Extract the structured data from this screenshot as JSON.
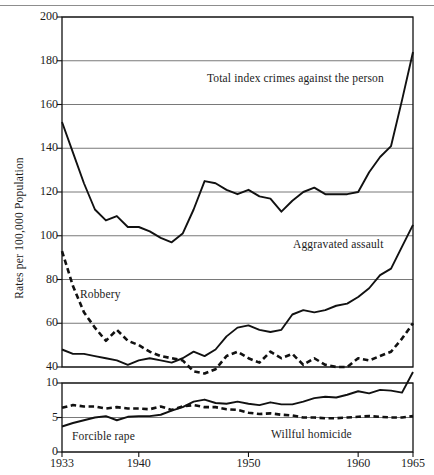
{
  "figure": {
    "ylabel": "Rates per 100,000 Population",
    "top_rule": true
  },
  "axes": {
    "upper": {
      "yticks": [
        200,
        180,
        160,
        140,
        120,
        100,
        80,
        60,
        40
      ],
      "ylim": [
        40,
        200
      ],
      "gridlines": true
    },
    "lower": {
      "yticks": [
        10,
        5,
        0
      ],
      "ylim": [
        0,
        10
      ],
      "gridlines": true
    },
    "xticks": [
      "1933",
      "1940",
      "1950",
      "1960",
      "1965"
    ],
    "xtick_values": [
      1933,
      1940,
      1950,
      1960,
      1965
    ],
    "xlim": [
      1933,
      1965
    ]
  },
  "labels": {
    "total_index": "Total index crimes against the person",
    "aggravated_assault": "Aggravated assault",
    "robbery": "Robbery",
    "forcible_rape": "Forcible rape",
    "willful_homicide": "Willful homicide"
  },
  "colors": {
    "line": "#111111",
    "grid": "#6a6a6a",
    "axis": "#111111",
    "background": "#ffffff"
  },
  "chart_data": {
    "type": "line",
    "title": "",
    "xlabel": "",
    "ylabel": "Rates per 100,000 Population",
    "panels": [
      {
        "name": "upper",
        "ylim": [
          40,
          200
        ],
        "yticks": [
          40,
          60,
          80,
          100,
          120,
          140,
          160,
          180,
          200
        ],
        "series": [
          {
            "name": "Total index crimes against the person",
            "style": "solid",
            "x": [
              1933,
              1934,
              1935,
              1936,
              1937,
              1938,
              1939,
              1940,
              1941,
              1942,
              1943,
              1944,
              1945,
              1946,
              1947,
              1948,
              1949,
              1950,
              1951,
              1952,
              1953,
              1954,
              1955,
              1956,
              1957,
              1958,
              1959,
              1960,
              1961,
              1962,
              1963,
              1964,
              1965
            ],
            "values": [
              152,
              138,
              124,
              112,
              107,
              109,
              104,
              104,
              102,
              99,
              97,
              101,
              112,
              125,
              124,
              121,
              119,
              121,
              118,
              117,
              111,
              116,
              120,
              122,
              119,
              119,
              119,
              120,
              129,
              136,
              141,
              162,
              184
            ]
          },
          {
            "name": "Robbery",
            "style": "dashed",
            "x": [
              1933,
              1934,
              1935,
              1936,
              1937,
              1938,
              1939,
              1940,
              1941,
              1942,
              1943,
              1944,
              1945,
              1946,
              1947,
              1948,
              1949,
              1950,
              1951,
              1952,
              1953,
              1954,
              1955,
              1956,
              1957,
              1958,
              1959,
              1960,
              1961,
              1962,
              1963,
              1964,
              1965
            ],
            "values": [
              93,
              77,
              65,
              58,
              52,
              57,
              52,
              50,
              47,
              45,
              44,
              43,
              38,
              37,
              39,
              45,
              47,
              44,
              42,
              47,
              44,
              46,
              41,
              44,
              41,
              40,
              40,
              44,
              43,
              45,
              47,
              53,
              60
            ]
          },
          {
            "name": "Aggravated assault",
            "style": "solid",
            "x": [
              1933,
              1934,
              1935,
              1936,
              1937,
              1938,
              1939,
              1940,
              1941,
              1942,
              1943,
              1944,
              1945,
              1946,
              1947,
              1948,
              1949,
              1950,
              1951,
              1952,
              1953,
              1954,
              1955,
              1956,
              1957,
              1958,
              1959,
              1960,
              1961,
              1962,
              1963,
              1964,
              1965
            ],
            "values": [
              48,
              46,
              46,
              45,
              44,
              43,
              41,
              43,
              44,
              43,
              42,
              44,
              47,
              45,
              48,
              54,
              58,
              59,
              57,
              56,
              57,
              64,
              66,
              65,
              66,
              68,
              69,
              72,
              76,
              82,
              85,
              95,
              105
            ]
          }
        ]
      },
      {
        "name": "lower",
        "ylim": [
          0,
          10
        ],
        "yticks": [
          0,
          5,
          10
        ],
        "series": [
          {
            "name": "Forcible rape",
            "style": "solid",
            "x": [
              1933,
              1934,
              1935,
              1936,
              1937,
              1938,
              1939,
              1940,
              1941,
              1942,
              1943,
              1944,
              1945,
              1946,
              1947,
              1948,
              1949,
              1950,
              1951,
              1952,
              1953,
              1954,
              1955,
              1956,
              1957,
              1958,
              1959,
              1960,
              1961,
              1962,
              1963,
              1964,
              1965
            ],
            "values": [
              3.7,
              4.2,
              4.6,
              5.0,
              5.2,
              4.6,
              5.1,
              5.2,
              5.2,
              5.4,
              6.0,
              6.5,
              7.3,
              7.6,
              7.1,
              7.0,
              7.3,
              7.0,
              6.8,
              7.2,
              6.9,
              6.9,
              7.3,
              7.8,
              8.0,
              7.9,
              8.3,
              8.8,
              8.5,
              9.0,
              8.9,
              8.6,
              11.6
            ]
          },
          {
            "name": "Willful homicide",
            "style": "dashed",
            "x": [
              1933,
              1934,
              1935,
              1936,
              1937,
              1938,
              1939,
              1940,
              1941,
              1942,
              1943,
              1944,
              1945,
              1946,
              1947,
              1948,
              1949,
              1950,
              1951,
              1952,
              1953,
              1954,
              1955,
              1956,
              1957,
              1958,
              1959,
              1960,
              1961,
              1962,
              1963,
              1964,
              1965
            ],
            "values": [
              6.4,
              6.8,
              6.6,
              6.6,
              6.3,
              6.5,
              6.3,
              6.3,
              6.2,
              6.6,
              6.1,
              6.6,
              6.8,
              6.5,
              6.5,
              6.2,
              6.1,
              5.7,
              5.5,
              5.6,
              5.4,
              5.3,
              5.0,
              5.0,
              4.9,
              4.9,
              5.0,
              5.1,
              5.2,
              5.1,
              5.0,
              5.0,
              5.2
            ]
          }
        ]
      }
    ],
    "annotations": [
      {
        "text": "Total index crimes against the person",
        "panel": "upper"
      },
      {
        "text": "Aggravated assault",
        "panel": "upper"
      },
      {
        "text": "Robbery",
        "panel": "upper"
      },
      {
        "text": "Forcible rape",
        "panel": "lower"
      },
      {
        "text": "Willful homicide",
        "panel": "lower"
      }
    ],
    "legend": "inline-annotations"
  }
}
